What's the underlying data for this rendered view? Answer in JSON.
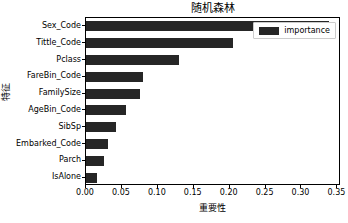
{
  "chart_data": {
    "type": "bar",
    "orientation": "horizontal",
    "title": "随机森林",
    "xlabel": "重要性",
    "ylabel": "特征",
    "categories": [
      "IsAlone",
      "Parch",
      "Embarked_Code",
      "SibSp",
      "AgeBin_Code",
      "FamilySize",
      "FareBin_Code",
      "Pclass",
      "Tittle_Code",
      "Sex_Code"
    ],
    "values": [
      0.016,
      0.025,
      0.031,
      0.042,
      0.055,
      0.075,
      0.08,
      0.13,
      0.205,
      0.338
    ],
    "series": [
      {
        "name": "importance",
        "color": "#262626",
        "values": [
          0.016,
          0.025,
          0.031,
          0.042,
          0.055,
          0.075,
          0.08,
          0.13,
          0.205,
          0.338
        ]
      }
    ],
    "xlim": [
      0.0,
      0.355
    ],
    "xticks": [
      0.0,
      0.05,
      0.1,
      0.15,
      0.2,
      0.25,
      0.3,
      0.35
    ],
    "xtick_labels": [
      "0.00",
      "0.05",
      "0.10",
      "0.15",
      "0.20",
      "0.25",
      "0.30",
      "0.35"
    ],
    "grid": false,
    "legend": {
      "entries": [
        "importance"
      ],
      "position": "upper right"
    }
  }
}
